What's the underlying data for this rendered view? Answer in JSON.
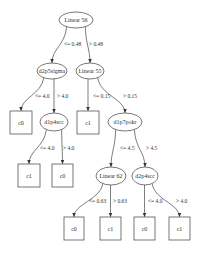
{
  "diagram": {
    "type": "decision-tree",
    "nodes": [
      {
        "id": "n0",
        "kind": "split",
        "label": "Linear 56",
        "cx": 76,
        "cy": 20,
        "rx": 17,
        "ry": 8
      },
      {
        "id": "n1",
        "kind": "split",
        "label": "d2p5sigma",
        "cx": 52,
        "cy": 71,
        "rx": 15,
        "ry": 8
      },
      {
        "id": "n2",
        "kind": "split",
        "label": "Linear 55",
        "cx": 90,
        "cy": 71,
        "rx": 14,
        "ry": 8
      },
      {
        "id": "n3",
        "kind": "leaf",
        "label": "c0",
        "x": 10,
        "y": 111,
        "w": 22,
        "h": 23
      },
      {
        "id": "n4",
        "kind": "split",
        "label": "d1p4scc",
        "cx": 54,
        "cy": 122,
        "rx": 14,
        "ry": 9
      },
      {
        "id": "n5",
        "kind": "leaf",
        "label": "c1",
        "x": 77,
        "y": 111,
        "w": 22,
        "h": 23
      },
      {
        "id": "n6",
        "kind": "split",
        "label": "d1p7pokr",
        "cx": 125,
        "cy": 122,
        "rx": 17,
        "ry": 9
      },
      {
        "id": "n7",
        "kind": "leaf",
        "label": "c1",
        "x": 18,
        "y": 164,
        "w": 22,
        "h": 23
      },
      {
        "id": "n8",
        "kind": "leaf",
        "label": "c0",
        "x": 52,
        "y": 164,
        "w": 21,
        "h": 23
      },
      {
        "id": "n9",
        "kind": "split",
        "label": "Linear 62",
        "cx": 111,
        "cy": 176,
        "rx": 15,
        "ry": 9
      },
      {
        "id": "n10",
        "kind": "split",
        "label": "d2p4scc",
        "cx": 145,
        "cy": 176,
        "rx": 13,
        "ry": 9
      },
      {
        "id": "n11",
        "kind": "leaf",
        "label": "c0",
        "x": 64,
        "y": 217,
        "w": 20,
        "h": 23
      },
      {
        "id": "n12",
        "kind": "leaf",
        "label": "c1",
        "x": 100,
        "y": 217,
        "w": 21,
        "h": 23
      },
      {
        "id": "n13",
        "kind": "leaf",
        "label": "c0",
        "x": 134,
        "y": 217,
        "w": 21,
        "h": 23
      },
      {
        "id": "n14",
        "kind": "leaf",
        "label": "c1",
        "x": 169,
        "y": 217,
        "w": 21,
        "h": 23
      }
    ],
    "edges": [
      {
        "from": "n0",
        "to": "n1",
        "label": "<= 0.48",
        "lx": 64,
        "ly": 46
      },
      {
        "from": "n0",
        "to": "n2",
        "label": "> 0.48",
        "lx": 89,
        "ly": 46
      },
      {
        "from": "n1",
        "to": "n3",
        "label": "<= 4.0",
        "lx": 35,
        "ly": 98
      },
      {
        "from": "n1",
        "to": "n4",
        "label": "> 4.0",
        "lx": 57,
        "ly": 98
      },
      {
        "from": "n2",
        "to": "n5",
        "label": "<= 0.15",
        "lx": 93,
        "ly": 98
      },
      {
        "from": "n2",
        "to": "n6",
        "label": "> 0.15",
        "lx": 123,
        "ly": 98
      },
      {
        "from": "n4",
        "to": "n7",
        "label": "<= 4.0",
        "lx": 40,
        "ly": 150
      },
      {
        "from": "n4",
        "to": "n8",
        "label": "> 4.0",
        "lx": 63,
        "ly": 150
      },
      {
        "from": "n6",
        "to": "n9",
        "label": "<= 4.5",
        "lx": 120,
        "ly": 150
      },
      {
        "from": "n6",
        "to": "n10",
        "label": "> 4.5",
        "lx": 146,
        "ly": 150
      },
      {
        "from": "n9",
        "to": "n11",
        "label": "<= 0.63",
        "lx": 89,
        "ly": 203
      },
      {
        "from": "n9",
        "to": "n12",
        "label": "> 0.63",
        "lx": 113,
        "ly": 203
      },
      {
        "from": "n10",
        "to": "n13",
        "label": "<= 4.0",
        "lx": 148,
        "ly": 203
      },
      {
        "from": "n10",
        "to": "n14",
        "label": "> 4.0",
        "lx": 176,
        "ly": 203
      }
    ]
  }
}
